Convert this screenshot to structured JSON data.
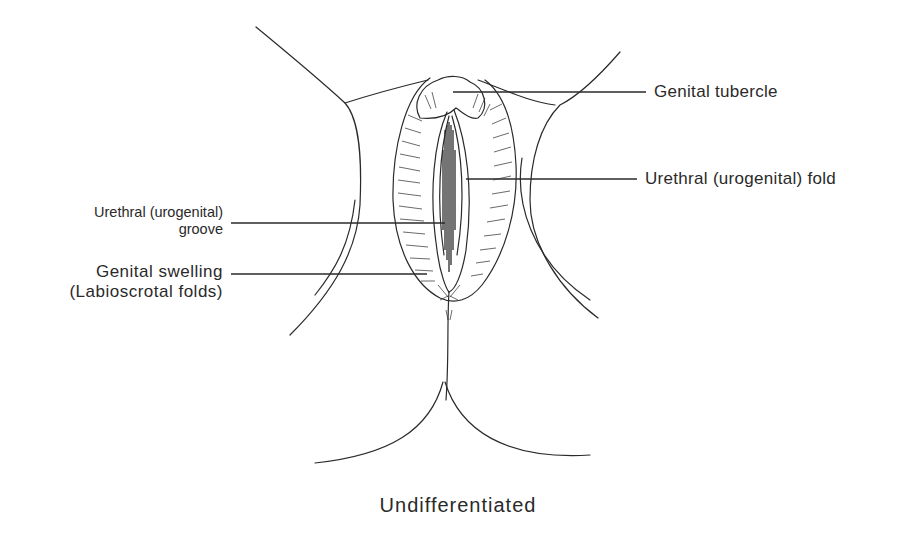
{
  "figure": {
    "caption": "Undifferentiated",
    "labels": {
      "genital_tubercle": "Genital tubercle",
      "urethral_fold": "Urethral (urogenital) fold",
      "urethral_groove_line1": "Urethral (urogenital)",
      "urethral_groove_line2": "groove",
      "genital_swelling_line1": "Genital swelling",
      "genital_swelling_line2": "(Labioscrotal folds)"
    },
    "colors": {
      "ink": "#2a2a2a",
      "background": "#ffffff"
    }
  }
}
